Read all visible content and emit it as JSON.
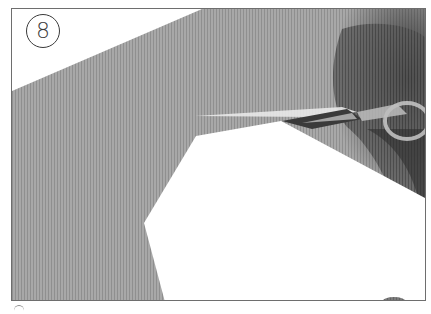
{
  "step": {
    "number": "8"
  },
  "illustration": {
    "subject": "scissors cutting paper",
    "icon": "scissors-icon",
    "colors": {
      "background_paper": "#a9a9a9",
      "cut_piece": "#ffffff",
      "hand_shadow": "#3c3c3c",
      "frame_border": "#6e6e6e"
    }
  }
}
